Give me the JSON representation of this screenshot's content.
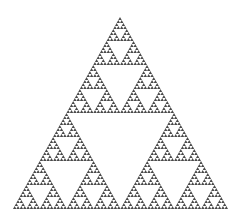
{
  "figure": {
    "background": "#ffffff",
    "fill_color": "#4a4a4a",
    "apex": [
      120,
      17
    ],
    "base_left": [
      13,
      209
    ],
    "base_right": [
      228,
      209
    ],
    "depth": 6
  }
}
